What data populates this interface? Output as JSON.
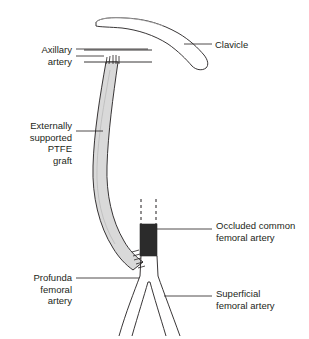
{
  "figure": {
    "background_color": "#ffffff",
    "line_color": "#231f20",
    "text_color": "#231f20",
    "graft_fill_color": "#d9d9d9",
    "occlusion_fill_color": "#2b2b2b"
  },
  "labels": {
    "axillary_artery": "Axillary\nartery",
    "ptfe_graft": "Externally\nsupported\nPTFE\ngraft",
    "profunda_femoral_artery": "Profunda\nfemoral\nartery",
    "clavicle": "Clavicle",
    "occluded_common_femoral_artery": "Occluded common\nfemoral artery",
    "superficial_femoral_artery": "Superficial\nfemoral artery"
  },
  "structures": [
    {
      "name": "clavicle",
      "kind": "bone-outline"
    },
    {
      "name": "axillary-artery",
      "kind": "vessel"
    },
    {
      "name": "ptfe-graft",
      "kind": "graft-conduit"
    },
    {
      "name": "proximal-anastomosis",
      "kind": "suture-line"
    },
    {
      "name": "distal-anastomosis",
      "kind": "suture-line"
    },
    {
      "name": "occluded-common-femoral-artery",
      "kind": "occluded-segment"
    },
    {
      "name": "common-femoral-artery-dashed",
      "kind": "dashed-vessel"
    },
    {
      "name": "profunda-femoral-artery",
      "kind": "vessel"
    },
    {
      "name": "superficial-femoral-artery",
      "kind": "vessel"
    }
  ]
}
